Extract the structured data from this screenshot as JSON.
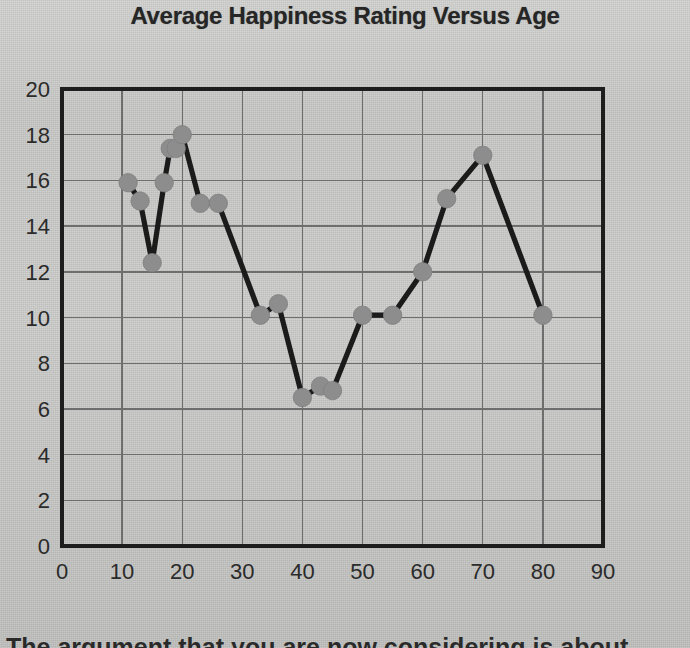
{
  "chart_data": {
    "type": "line",
    "title": "Average Happiness Rating Versus Age",
    "xlabel": "",
    "ylabel": "",
    "xlim": [
      0,
      90
    ],
    "ylim": [
      0,
      20
    ],
    "xticks": [
      0,
      10,
      20,
      30,
      40,
      50,
      60,
      70,
      80,
      90
    ],
    "yticks": [
      0,
      2,
      4,
      6,
      8,
      10,
      12,
      14,
      16,
      18,
      20
    ],
    "grid": true,
    "legend": "none",
    "marker": "circle",
    "marker_color": "#8d8d8d",
    "line_color": "#1b1b1b",
    "x": [
      11,
      13,
      15,
      17,
      18,
      19,
      20,
      23,
      26,
      33,
      36,
      40,
      43,
      45,
      50,
      55,
      60,
      64,
      70,
      80
    ],
    "y": [
      15.9,
      15.1,
      12.4,
      15.9,
      17.4,
      17.4,
      18.0,
      15.0,
      15.0,
      10.1,
      10.6,
      6.5,
      7.0,
      6.8,
      10.1,
      10.1,
      12.0,
      15.2,
      17.1,
      10.1
    ],
    "points": [
      {
        "age": 11,
        "rating": 15.9
      },
      {
        "age": 13,
        "rating": 15.1
      },
      {
        "age": 15,
        "rating": 12.4
      },
      {
        "age": 17,
        "rating": 15.9
      },
      {
        "age": 18,
        "rating": 17.4
      },
      {
        "age": 19,
        "rating": 17.4
      },
      {
        "age": 20,
        "rating": 18.0
      },
      {
        "age": 23,
        "rating": 15.0
      },
      {
        "age": 26,
        "rating": 15.0
      },
      {
        "age": 33,
        "rating": 10.1
      },
      {
        "age": 36,
        "rating": 10.6
      },
      {
        "age": 40,
        "rating": 6.5
      },
      {
        "age": 43,
        "rating": 7.0
      },
      {
        "age": 45,
        "rating": 6.8
      },
      {
        "age": 50,
        "rating": 10.1
      },
      {
        "age": 55,
        "rating": 10.1
      },
      {
        "age": 60,
        "rating": 12.0
      },
      {
        "age": 64,
        "rating": 15.2
      },
      {
        "age": 70,
        "rating": 17.1
      },
      {
        "age": 80,
        "rating": 10.1
      }
    ]
  },
  "caption": {
    "cut_off_line": "The argument that you are now considering is about"
  },
  "colors": {
    "background": "#c9c9c7",
    "axis": "#1d1d1d",
    "grid": "#6e6e6e",
    "marker": "#8d8d8d",
    "line": "#1b1b1b",
    "text": "#262626"
  }
}
